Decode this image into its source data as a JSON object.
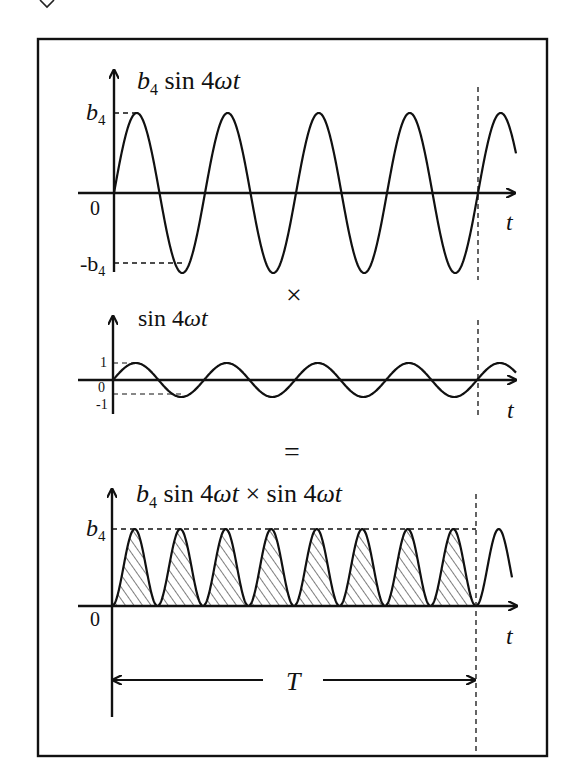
{
  "figure": {
    "frame": {
      "x": 38,
      "y": 39,
      "width": 509,
      "height": 717
    },
    "operators": {
      "times": "×",
      "equals": "="
    },
    "period_label": "T",
    "colors": {
      "ink": "#111111",
      "background": "#ffffff"
    }
  },
  "panels": [
    {
      "id": "top",
      "title_parts": {
        "coef": "b",
        "coef_sub": "4",
        "fn": " sin 4",
        "omega": "ω",
        "t": "t"
      },
      "title_text": "b4 sin 4ωt",
      "y_labels": {
        "max": "b",
        "max_sub": "4",
        "zero": "0",
        "min": "-b",
        "min_sub": "4"
      },
      "x_label": "t",
      "curve": "b4 sin 4ωt",
      "amplitude_label": "b4"
    },
    {
      "id": "middle",
      "title_text": "sin 4ωt",
      "title_parts": {
        "fn": "sin 4",
        "omega": "ω",
        "t": "t"
      },
      "y_labels": {
        "max": "1",
        "zero": "0",
        "min": "-1"
      },
      "x_label": "t",
      "curve": "sin 4ωt"
    },
    {
      "id": "bottom",
      "title_text": "b4 sin 4ωt × sin 4ωt",
      "title_parts": {
        "coef": "b",
        "coef_sub": "4",
        "fn": " sin 4",
        "omega": "ω",
        "t": "t",
        "times": " × sin 4",
        "omega2": "ω",
        "t2": "t"
      },
      "y_labels": {
        "max": "b",
        "max_sub": "4",
        "zero": "0"
      },
      "x_label": "t",
      "curve": "b4 sin² 4ωt (shaded area over one period T)"
    }
  ],
  "chart_data": [
    {
      "type": "line",
      "title": "b4 sin 4ωt",
      "xlabel": "t",
      "ylabel": "",
      "y_ticks": [
        "-b4",
        "0",
        "b4"
      ],
      "ylim": [
        -1,
        1
      ],
      "series": [
        {
          "name": "b4 sin 4ωt",
          "cycles_in_T": 4,
          "amplitude": "b4"
        }
      ]
    },
    {
      "type": "line",
      "title": "sin 4ωt",
      "xlabel": "t",
      "y_ticks": [
        "-1",
        "0",
        "1"
      ],
      "ylim": [
        -1,
        1
      ],
      "series": [
        {
          "name": "sin 4ωt",
          "cycles_in_T": 4,
          "amplitude": 1
        }
      ]
    },
    {
      "type": "area",
      "title": "b4 sin 4ωt × sin 4ωt",
      "xlabel": "t",
      "y_ticks": [
        "0",
        "b4"
      ],
      "ylim": [
        0,
        1
      ],
      "series": [
        {
          "name": "b4 sin² 4ωt",
          "humps_in_T": 8,
          "peak": "b4",
          "shaded": true
        }
      ],
      "annotations": [
        "T (one fundamental period, marked by dashed vertical line)"
      ]
    }
  ]
}
